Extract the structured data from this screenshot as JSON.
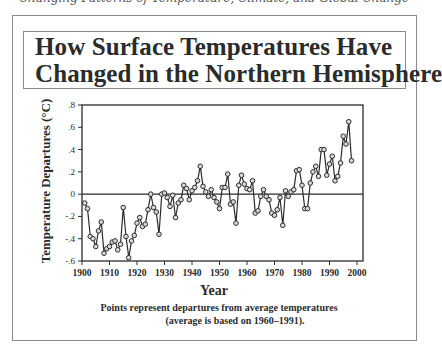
{
  "page": {
    "top_fragment": "Changing Patterns of Temperature, Climate, and Global Change"
  },
  "chart_data": {
    "type": "line",
    "title": "How Surface Temperatures Have Changed in the Northern Hemisphere",
    "title_line1": "How Surface Temperatures Have",
    "title_line2": "Changed in the Northern Hemisphere",
    "xlabel": "Year",
    "ylabel": "Temperature Departures (°C)",
    "note_line1": "Points represent departures from average temperatures",
    "note_line2": "(average is based on 1960–1991).",
    "xlim": [
      1900,
      2000
    ],
    "ylim": [
      -0.6,
      0.8
    ],
    "x_ticks": [
      "1900",
      "1910",
      "1920",
      "1930",
      "1940",
      "1950",
      "1960",
      "1970",
      "1980",
      "1990",
      "2000"
    ],
    "y_ticks": [
      ".8",
      ".6",
      ".4",
      ".2",
      "0",
      "-.2",
      "-.4",
      "-.6"
    ],
    "y_tick_values": [
      0.8,
      0.6,
      0.4,
      0.2,
      0,
      -0.2,
      -0.4,
      -0.6
    ],
    "reference_line": 0,
    "grid": false,
    "legend": null,
    "series": [
      {
        "name": "Northern Hemisphere temperature departure",
        "marker": "open-circle",
        "x": [
          1901,
          1902,
          1903,
          1904,
          1905,
          1906,
          1907,
          1908,
          1909,
          1910,
          1911,
          1912,
          1913,
          1914,
          1915,
          1916,
          1917,
          1918,
          1919,
          1920,
          1921,
          1922,
          1923,
          1924,
          1925,
          1926,
          1927,
          1928,
          1929,
          1930,
          1931,
          1932,
          1933,
          1934,
          1935,
          1936,
          1937,
          1938,
          1939,
          1940,
          1941,
          1942,
          1943,
          1944,
          1945,
          1946,
          1947,
          1948,
          1949,
          1950,
          1951,
          1952,
          1953,
          1954,
          1955,
          1956,
          1957,
          1958,
          1959,
          1960,
          1961,
          1962,
          1963,
          1964,
          1965,
          1966,
          1967,
          1968,
          1969,
          1970,
          1971,
          1972,
          1973,
          1974,
          1975,
          1976,
          1977,
          1978,
          1979,
          1980,
          1981,
          1982,
          1983,
          1984,
          1985,
          1986,
          1987,
          1988,
          1989,
          1990,
          1991,
          1992,
          1993,
          1994,
          1995,
          1996,
          1997,
          1998
        ],
        "values": [
          -0.08,
          -0.13,
          -0.38,
          -0.4,
          -0.47,
          -0.33,
          -0.25,
          -0.53,
          -0.49,
          -0.47,
          -0.43,
          -0.42,
          -0.5,
          -0.45,
          -0.12,
          -0.38,
          -0.57,
          -0.42,
          -0.37,
          -0.26,
          -0.21,
          -0.29,
          -0.27,
          -0.14,
          0.0,
          -0.12,
          -0.16,
          -0.36,
          0.0,
          0.01,
          -0.03,
          -0.11,
          -0.01,
          -0.21,
          -0.08,
          -0.05,
          0.08,
          0.05,
          -0.05,
          0.03,
          0.06,
          0.12,
          0.25,
          0.07,
          0.02,
          -0.02,
          0.04,
          -0.03,
          -0.07,
          -0.13,
          0.06,
          0.06,
          0.18,
          -0.09,
          -0.07,
          -0.26,
          0.08,
          0.17,
          0.09,
          0.05,
          0.04,
          0.12,
          -0.17,
          -0.15,
          -0.02,
          0.04,
          -0.02,
          -0.05,
          -0.17,
          -0.19,
          -0.14,
          -0.03,
          -0.28,
          0.03,
          -0.02,
          0.02,
          0.04,
          0.21,
          0.22,
          0.08,
          -0.13,
          -0.13,
          0.1,
          0.2,
          0.25,
          0.16,
          0.4,
          0.4,
          0.17,
          0.27,
          0.34,
          0.12,
          0.16,
          0.28,
          0.52,
          0.45,
          0.65,
          0.3
        ]
      }
    ]
  }
}
